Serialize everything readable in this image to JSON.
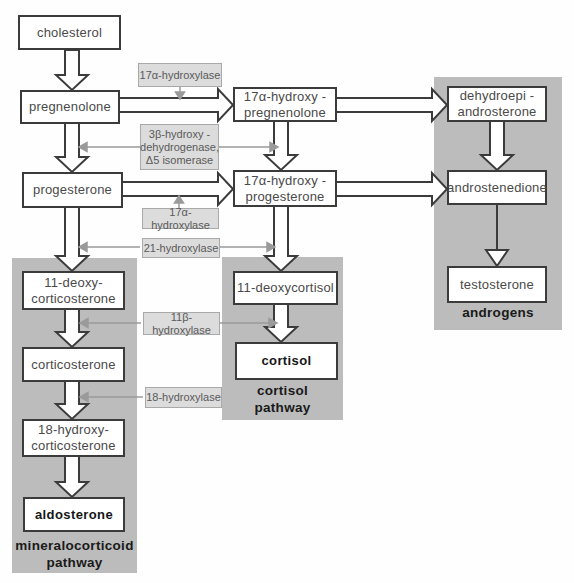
{
  "colors": {
    "region_grey": "#bcbcbc",
    "enzyme_fill": "#dcdcdc",
    "enzyme_border": "#a9a9a9",
    "box_border": "#3b3b3b",
    "big_arrow_outline": "#3b3b3b",
    "grey_arrow": "#9a9a9a"
  },
  "nodes": {
    "cholesterol": {
      "label": "cholesterol"
    },
    "pregnenolone": {
      "label": "pregnenolone"
    },
    "progesterone": {
      "label": "progesterone"
    },
    "ohpregnenolone": {
      "line1": "17α-hydroxy -",
      "line2": "pregnenolone"
    },
    "ohprogesterone": {
      "line1": "17α-hydroxy -",
      "line2": "progesterone"
    },
    "dhea": {
      "line1": "dehydroepi -",
      "line2": "androsterone"
    },
    "androstenedione": {
      "label": "androstenedione"
    },
    "testosterone": {
      "label": "testosterone"
    },
    "doc": {
      "line1": "11-deoxy-",
      "line2": "corticosterone"
    },
    "corticosterone": {
      "label": "corticosterone"
    },
    "ohcorticosterone": {
      "line1": "18-hydroxy-",
      "line2": "corticosterone"
    },
    "aldosterone": {
      "label": "aldosterone"
    },
    "deoxycortisol": {
      "label": "11-deoxycortisol"
    },
    "cortisol": {
      "label": "cortisol"
    }
  },
  "enzymes": {
    "hydroxylase17a_top": {
      "label": "17α-hydroxylase"
    },
    "dehydrogenase3b": {
      "line1": "3β-hydroxy -",
      "line2": "dehydrogenase,",
      "line3": "Δ5 isomerase"
    },
    "hydroxylase17a_mid": {
      "label": "17α-hydroxylase"
    },
    "hydroxylase21": {
      "label": "21-hydroxylase"
    },
    "hydroxylase11b": {
      "label": "11β-hydroxylase"
    },
    "hydroxylase18": {
      "label": "18-hydroxylase"
    }
  },
  "pathways": {
    "androgens": {
      "label": "androgens"
    },
    "cortisol": {
      "line1": "cortisol",
      "line2": "pathway"
    },
    "mineralocorticoid": {
      "line1": "mineralocorticoid",
      "line2": "pathway"
    }
  }
}
